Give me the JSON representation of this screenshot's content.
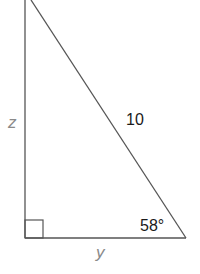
{
  "diagram": {
    "type": "right-triangle",
    "labels": {
      "vertical_side": "z",
      "hypotenuse": "10",
      "angle": "58°",
      "horizontal_side": "y"
    },
    "right_angle_marker": "bottom-left",
    "colors": {
      "line": "#555555",
      "variable_text": "#8a8a8a",
      "number_text": "#1a1a1a"
    }
  }
}
